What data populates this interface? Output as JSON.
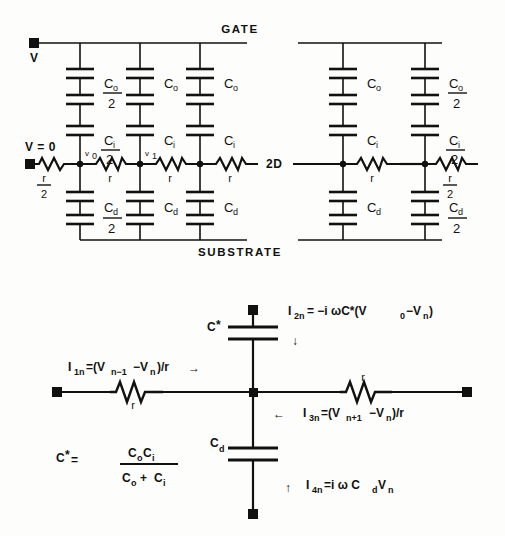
{
  "figure": {
    "kind": "circuit-diagram",
    "background": "#fdfdfb",
    "ink": "#111111"
  },
  "top_circuit": {
    "rails": {
      "gate": "GATE",
      "substrate": "SUBSTRATE"
    },
    "terminals": {
      "gate_terminal_label": "V",
      "source_terminal_label": "V = 0"
    },
    "middle_label": "2D",
    "node_labels": [
      "v",
      "v"
    ],
    "node_subscripts": [
      "0",
      "1"
    ],
    "left_series_resistor": {
      "num": "r",
      "den": "2"
    },
    "right_series_resistor": {
      "num": "r",
      "den": "2"
    },
    "series_resistors": [
      "r",
      "r",
      "r",
      "r",
      "r"
    ],
    "left_branch_caps": [
      {
        "num": "C",
        "sub": "o",
        "den": "2"
      },
      {
        "num": "C",
        "sub": "i",
        "den": "2"
      },
      {
        "num": "C",
        "sub": "d",
        "den": "2"
      }
    ],
    "right_branch_caps": [
      {
        "num": "C",
        "sub": "o",
        "den": "2"
      },
      {
        "num": "C",
        "sub": "i",
        "den": "2"
      },
      {
        "num": "C",
        "sub": "d",
        "den": "2"
      }
    ],
    "inner_caps": [
      {
        "num": "C",
        "sub": "o",
        "den": ""
      },
      {
        "num": "C",
        "sub": "i",
        "den": ""
      },
      {
        "num": "C",
        "sub": "d",
        "den": ""
      }
    ]
  },
  "bottom_circuit": {
    "cap_star_label": {
      "main": "C",
      "star": "*"
    },
    "cap_d_label": {
      "main": "C",
      "sub": "d"
    },
    "resistor_left_label": "r",
    "resistor_right_label": "r",
    "currents": {
      "i1n": {
        "name": "I",
        "sub": "1n",
        "expr": "=(V",
        "exp_sub1": "n−1",
        "minus": "−V",
        "exp_sub2": "n",
        "tail": ")/r",
        "arrow": "→"
      },
      "i2n": {
        "name": "I",
        "sub": "2n",
        "expr": "= −i ωC*(V",
        "exp_sub1": "0",
        "minus": "−V",
        "exp_sub2": "n",
        "tail": ")",
        "arrow": "↓"
      },
      "i3n": {
        "name": "I",
        "sub": "3n",
        "expr": "=(V",
        "exp_sub1": "n+1",
        "minus": "−V",
        "exp_sub2": "n",
        "tail": ")/r",
        "arrow": "←"
      },
      "i4n": {
        "name": "I",
        "sub": "4n",
        "expr": "=i ω C",
        "exp_sub1": "d",
        "minus": "V",
        "exp_sub2": "n",
        "tail": "",
        "arrow": "↑"
      }
    },
    "cstar_formula": {
      "lhs": "C",
      "star": "*",
      "eq": "=",
      "num_a": "C",
      "num_a_sub": "o",
      "num_b": "C",
      "num_b_sub": "i",
      "den_a": "C",
      "den_a_sub": "o",
      "plus": "+",
      "den_b": "C",
      "den_b_sub": "i"
    }
  }
}
